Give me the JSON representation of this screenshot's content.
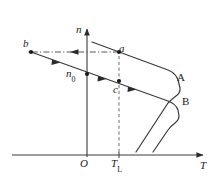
{
  "figure": {
    "type": "diagram",
    "background_color": "#ffffff",
    "line_color": "#2b2b2b",
    "text_color": "#1a1a1a",
    "axes": {
      "vertical": {
        "name": "n-axis",
        "label": "n",
        "style": "italic",
        "arrow": "up",
        "x": 87,
        "y_top": 26,
        "y_bottom": 157
      },
      "horizontal": {
        "name": "T-axis",
        "label": "T",
        "style": "italic",
        "arrow": "right",
        "y": 155,
        "x_left": 12,
        "x_right": 206
      },
      "origin_label": "O"
    },
    "tick_labels": [
      {
        "name": "origin",
        "text": "O",
        "axis": "x",
        "x": 87
      },
      {
        "name": "load-torque",
        "text": "T",
        "subscript": "L",
        "axis": "x",
        "x": 119
      }
    ],
    "points": [
      {
        "name": "point-b",
        "label": "b",
        "x": 31,
        "y": 52,
        "style": "italic"
      },
      {
        "name": "point-a",
        "label": "a",
        "x": 119,
        "y": 52,
        "style": "italic"
      },
      {
        "name": "point-c",
        "label": "c",
        "x": 119,
        "y": 81,
        "style": "italic"
      },
      {
        "name": "point-n0",
        "label": "n",
        "subscript": "0",
        "x": 87,
        "y": 74,
        "style": "italic"
      }
    ],
    "curves": [
      {
        "name": "curve-A",
        "label": "A",
        "style": "solid",
        "description": "upper characteristic curve: gentle downward slope then sharp knee down to T axis"
      },
      {
        "name": "curve-B",
        "label": "B",
        "style": "solid",
        "description": "lower characteristic curve: parallel to A, shifted down and right"
      }
    ],
    "connector_lines": [
      {
        "name": "dashed-horizontal-b-to-a",
        "style": "dash-dot",
        "from": "a",
        "to": "b",
        "arrow": "left"
      },
      {
        "name": "dashed-vertical-TL",
        "style": "dashed",
        "from": "T_L on axis",
        "to": "point a"
      }
    ]
  }
}
